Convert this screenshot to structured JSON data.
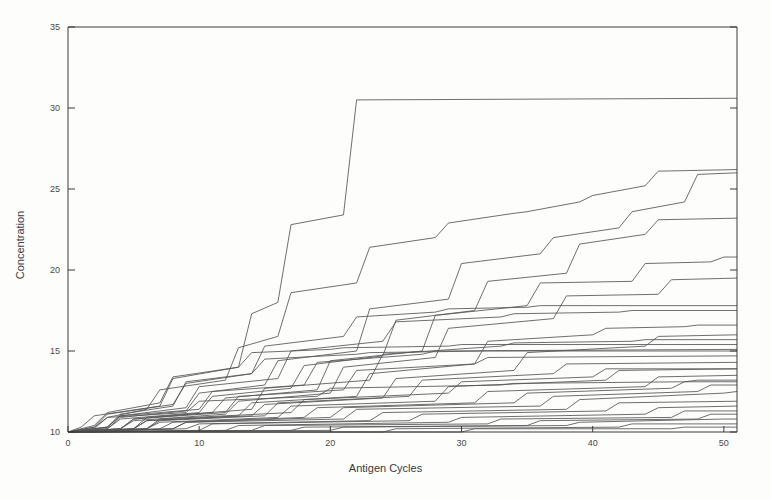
{
  "figure": {
    "background_color": "#fdfdfc",
    "line_color": "#555555",
    "axis_color": "#3a3a3a"
  },
  "chart_data": {
    "type": "line",
    "title": "",
    "subtitle": "",
    "xlabel": "Antigen Cycles",
    "ylabel": "Concentration",
    "xlim": [
      0,
      51
    ],
    "ylim": [
      10,
      35
    ],
    "xticks": [
      0,
      10,
      20,
      30,
      40,
      50
    ],
    "xticklabels": [
      "0",
      "10",
      "20",
      "30",
      "40",
      "50"
    ],
    "yticks": [
      10,
      15,
      20,
      25,
      30,
      35
    ],
    "yticklabels": [
      "10",
      "15",
      "20",
      "25",
      "30",
      "35"
    ],
    "grid": false,
    "legend": "none",
    "annotations": [],
    "note": "Step-like monotonically increasing staircase trajectories; every series starts at (0, 10). Values are read off the axes and are approximate.",
    "series": [
      {
        "name": "series-01",
        "x": [
          0,
          1,
          2,
          7,
          8,
          13,
          14,
          16,
          17,
          21,
          22,
          51
        ],
        "values": [
          10.0,
          10.3,
          11.0,
          11.6,
          13.3,
          14.0,
          17.3,
          18.0,
          22.8,
          23.4,
          30.5,
          30.6
        ]
      },
      {
        "name": "series-02",
        "x": [
          0,
          2,
          3,
          6,
          7,
          12,
          13,
          16,
          17,
          22,
          23,
          28,
          29,
          34,
          35,
          39,
          40,
          44,
          45,
          51
        ],
        "values": [
          10.0,
          10.2,
          10.9,
          11.4,
          12.6,
          13.2,
          15.2,
          15.9,
          18.6,
          19.2,
          21.4,
          22.0,
          22.9,
          23.5,
          23.6,
          24.2,
          24.6,
          25.2,
          26.1,
          26.2
        ]
      },
      {
        "name": "series-03",
        "x": [
          0,
          3,
          4,
          9,
          10,
          15,
          16,
          22,
          23,
          29,
          30,
          36,
          37,
          42,
          43,
          47,
          48,
          51
        ],
        "values": [
          10.0,
          10.2,
          10.9,
          11.3,
          12.4,
          12.9,
          14.4,
          15.0,
          17.6,
          18.2,
          20.4,
          21.0,
          22.0,
          22.6,
          23.6,
          24.2,
          25.9,
          26.0
        ]
      },
      {
        "name": "series-04",
        "x": [
          0,
          3,
          4,
          10,
          11,
          17,
          18,
          24,
          25,
          31,
          32,
          38,
          39,
          44,
          45,
          51
        ],
        "values": [
          10.0,
          10.2,
          10.8,
          11.2,
          12.2,
          12.7,
          14.1,
          14.7,
          16.9,
          17.5,
          19.3,
          19.8,
          21.6,
          22.2,
          23.1,
          23.2
        ]
      },
      {
        "name": "series-05",
        "x": [
          0,
          4,
          5,
          11,
          12,
          19,
          20,
          27,
          28,
          35,
          36,
          43,
          44,
          49,
          50,
          51
        ],
        "values": [
          10.0,
          10.2,
          10.8,
          11.2,
          12.1,
          12.6,
          14.4,
          15.0,
          17.2,
          17.8,
          19.2,
          19.3,
          20.4,
          20.5,
          20.8,
          20.8
        ]
      },
      {
        "name": "series-06",
        "x": [
          0,
          4,
          5,
          12,
          13,
          20,
          21,
          28,
          29,
          37,
          38,
          45,
          46,
          51
        ],
        "values": [
          10.0,
          10.2,
          10.7,
          11.1,
          11.9,
          12.4,
          14.0,
          14.6,
          16.4,
          17.0,
          18.4,
          18.5,
          19.4,
          19.5
        ]
      },
      {
        "name": "series-07",
        "x": [
          0,
          2,
          3,
          8,
          9,
          14,
          15,
          21,
          22,
          28,
          29,
          35,
          36,
          51
        ],
        "values": [
          10.0,
          10.3,
          11.1,
          11.7,
          13.0,
          13.6,
          15.3,
          15.9,
          17.1,
          17.4,
          17.6,
          17.7,
          17.8,
          17.8
        ]
      },
      {
        "name": "series-08",
        "x": [
          0,
          3,
          4,
          9,
          10,
          16,
          17,
          24,
          25,
          33,
          34,
          42,
          43,
          51
        ],
        "values": [
          10.0,
          10.3,
          11.0,
          11.5,
          12.8,
          13.3,
          15.0,
          15.6,
          16.8,
          17.1,
          17.3,
          17.4,
          17.5,
          17.5
        ]
      },
      {
        "name": "series-09",
        "x": [
          0,
          5,
          6,
          13,
          14,
          22,
          23,
          31,
          32,
          40,
          41,
          47,
          48,
          51
        ],
        "values": [
          10.0,
          10.2,
          10.7,
          11.0,
          11.8,
          12.2,
          13.6,
          14.2,
          15.6,
          16.0,
          16.4,
          16.5,
          16.6,
          16.6
        ]
      },
      {
        "name": "series-10",
        "x": [
          0,
          5,
          6,
          14,
          15,
          24,
          25,
          34,
          35,
          44,
          45,
          51
        ],
        "values": [
          10.0,
          10.2,
          10.7,
          11.0,
          11.7,
          12.1,
          13.3,
          13.8,
          14.9,
          15.3,
          15.9,
          16.0
        ]
      },
      {
        "name": "series-11",
        "x": [
          0,
          3,
          4,
          10,
          11,
          18,
          19,
          27,
          28,
          51
        ],
        "values": [
          10.0,
          10.3,
          11.0,
          11.4,
          12.5,
          12.9,
          14.3,
          14.8,
          15.0,
          15.1
        ]
      },
      {
        "name": "series-12",
        "x": [
          0,
          4,
          5,
          12,
          13,
          21,
          22,
          31,
          32,
          51
        ],
        "values": [
          10.0,
          10.2,
          10.8,
          11.2,
          12.2,
          12.6,
          13.8,
          14.2,
          14.6,
          14.7
        ]
      },
      {
        "name": "series-13",
        "x": [
          0,
          6,
          7,
          15,
          16,
          26,
          27,
          37,
          38,
          51
        ],
        "values": [
          10.0,
          10.2,
          10.7,
          11.0,
          11.8,
          12.2,
          13.2,
          13.6,
          14.2,
          14.3
        ]
      },
      {
        "name": "series-14",
        "x": [
          0,
          6,
          7,
          16,
          17,
          28,
          29,
          41,
          42,
          51
        ],
        "values": [
          10.0,
          10.2,
          10.6,
          10.9,
          11.6,
          11.9,
          12.8,
          13.2,
          13.8,
          13.9
        ]
      },
      {
        "name": "series-15",
        "x": [
          0,
          7,
          8,
          18,
          19,
          31,
          32,
          44,
          45,
          51
        ],
        "values": [
          10.0,
          10.2,
          10.6,
          10.9,
          11.5,
          11.8,
          12.5,
          12.8,
          13.4,
          13.5
        ]
      },
      {
        "name": "series-16",
        "x": [
          0,
          2,
          3,
          9,
          10,
          19,
          20,
          33,
          34,
          47,
          48,
          51
        ],
        "values": [
          10.0,
          10.3,
          10.9,
          11.2,
          11.9,
          12.2,
          12.7,
          12.9,
          13.0,
          13.1,
          13.2,
          13.2
        ]
      },
      {
        "name": "series-17",
        "x": [
          0,
          8,
          9,
          21,
          22,
          36,
          37,
          48,
          49,
          51
        ],
        "values": [
          10.0,
          10.2,
          10.6,
          10.8,
          11.4,
          11.6,
          12.2,
          12.5,
          12.9,
          12.9
        ]
      },
      {
        "name": "series-18",
        "x": [
          0,
          9,
          10,
          23,
          24,
          38,
          39,
          50,
          51
        ],
        "values": [
          10.0,
          10.2,
          10.5,
          10.7,
          11.2,
          11.4,
          12.0,
          12.4,
          12.5
        ]
      },
      {
        "name": "series-19",
        "x": [
          0,
          10,
          11,
          26,
          27,
          41,
          42,
          51
        ],
        "values": [
          10.0,
          10.1,
          10.5,
          10.7,
          11.1,
          11.3,
          11.8,
          11.9
        ]
      },
      {
        "name": "series-20",
        "x": [
          0,
          12,
          13,
          29,
          30,
          44,
          45,
          51
        ],
        "values": [
          10.0,
          10.1,
          10.4,
          10.6,
          10.9,
          11.1,
          11.5,
          11.6
        ]
      },
      {
        "name": "series-21",
        "x": [
          0,
          14,
          15,
          32,
          33,
          46,
          47,
          51
        ],
        "values": [
          10.0,
          10.1,
          10.4,
          10.5,
          10.8,
          10.9,
          11.3,
          11.3
        ]
      },
      {
        "name": "series-22",
        "x": [
          0,
          17,
          18,
          35,
          36,
          48,
          49,
          51
        ],
        "values": [
          10.0,
          10.1,
          10.3,
          10.4,
          10.7,
          10.8,
          11.1,
          11.1
        ]
      },
      {
        "name": "series-23",
        "x": [
          0,
          20,
          21,
          38,
          39,
          50,
          51
        ],
        "values": [
          10.0,
          10.1,
          10.3,
          10.4,
          10.6,
          10.8,
          10.8
        ]
      },
      {
        "name": "series-24",
        "x": [
          0,
          24,
          25,
          42,
          43,
          51
        ],
        "values": [
          10.0,
          10.0,
          10.2,
          10.3,
          10.5,
          10.5
        ]
      },
      {
        "name": "series-25",
        "x": [
          0,
          30,
          31,
          46,
          47,
          51
        ],
        "values": [
          10.0,
          10.0,
          10.2,
          10.2,
          10.3,
          10.3
        ]
      },
      {
        "name": "series-26",
        "x": [
          0,
          5,
          6,
          14,
          15,
          23,
          24,
          33,
          34,
          43,
          44,
          51
        ],
        "values": [
          10.0,
          10.2,
          10.9,
          11.4,
          12.7,
          13.2,
          14.8,
          15.3,
          15.5,
          15.6,
          15.7,
          15.7
        ]
      },
      {
        "name": "series-27",
        "x": [
          0,
          2,
          3,
          7,
          8,
          13,
          14,
          20,
          21,
          29,
          30,
          51
        ],
        "values": [
          10.0,
          10.4,
          11.2,
          11.8,
          13.4,
          14.0,
          14.9,
          15.1,
          15.2,
          15.3,
          15.4,
          15.4
        ]
      },
      {
        "name": "series-28",
        "x": [
          0,
          3,
          4,
          8,
          9,
          14,
          15,
          22,
          23,
          32,
          33,
          51
        ],
        "values": [
          10.0,
          10.3,
          11.1,
          11.6,
          13.1,
          13.6,
          14.5,
          14.8,
          14.9,
          15.0,
          15.0,
          15.0
        ]
      },
      {
        "name": "series-29",
        "x": [
          0,
          6,
          7,
          17,
          18,
          29,
          30,
          40,
          41,
          51
        ],
        "values": [
          10.0,
          10.2,
          10.8,
          11.2,
          12.0,
          12.4,
          13.1,
          13.4,
          13.9,
          13.9
        ]
      },
      {
        "name": "series-30",
        "x": [
          0,
          8,
          9,
          20,
          21,
          34,
          35,
          46,
          47,
          51
        ],
        "values": [
          10.0,
          10.2,
          10.6,
          10.9,
          11.5,
          11.8,
          12.4,
          12.7,
          13.1,
          13.1
        ]
      }
    ]
  }
}
